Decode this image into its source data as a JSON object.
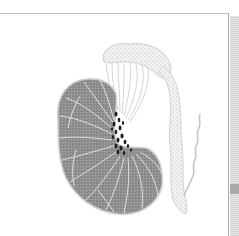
{
  "figure": {
    "colors": {
      "background": "#ffffff",
      "frame_line": "#b0b0b0",
      "testis_fill": "#8f8f8f",
      "septa": "#e8e8e8",
      "rete_dark": "#1e1e1e",
      "epididymis": "#d4d4d4",
      "shadow": "#dcdcdc",
      "shadow_band": "#a8a8a8"
    }
  }
}
